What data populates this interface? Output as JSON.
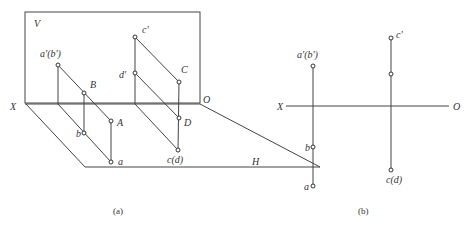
{
  "figure_a": {
    "caption": "(a)",
    "plane_v_label": "V",
    "plane_h_label": "H",
    "axis_x_label": "X",
    "axis_o_label": "O",
    "points": {
      "a_prime_b_prime": "a'(b')",
      "B": "B",
      "A": "A",
      "b": "b",
      "a": "a",
      "c_prime": "c'",
      "d_prime": "d'",
      "C": "C",
      "D": "D",
      "c_d": "c(d)"
    }
  },
  "figure_b": {
    "caption": "(b)",
    "axis_x_label": "X",
    "axis_o_label": "O",
    "points": {
      "a_prime_b_prime": "a'(b')",
      "c_prime": "c'",
      "b": "b",
      "a": "a",
      "c_d": "c(d)"
    }
  }
}
